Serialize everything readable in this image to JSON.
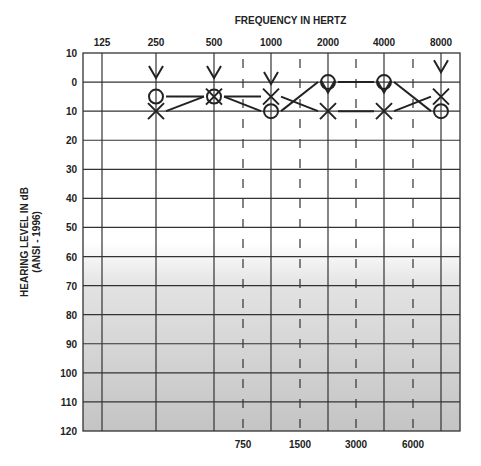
{
  "chart_data": {
    "type": "scatter",
    "title": "FREQUENCY IN HERTZ",
    "ylabel": "HEARING LEVEL IN dB (ANSI - 1996)",
    "ylabel_line1": "HEARING LEVEL IN dB",
    "ylabel_line2": "(ANSI - 1996)",
    "x_top_ticks": [
      "125",
      "250",
      "500",
      "1000",
      "2000",
      "4000",
      "8000"
    ],
    "x_bottom_ticks": [
      "750",
      "1500",
      "3000",
      "6000"
    ],
    "y_ticks": [
      "10",
      "0",
      "10",
      "20",
      "30",
      "40",
      "50",
      "60",
      "70",
      "80",
      "90",
      "100",
      "110",
      "120"
    ],
    "ylim": [
      -10,
      120
    ],
    "y_inverted": true,
    "grid": true,
    "categories": [
      250,
      500,
      1000,
      2000,
      4000,
      8000
    ],
    "series": [
      {
        "name": "Right ear air conduction (O)",
        "symbol": "circle",
        "values": [
          5,
          5,
          10,
          0,
          0,
          10
        ]
      },
      {
        "name": "Left ear air conduction (X)",
        "symbol": "x",
        "values": [
          10,
          5,
          5,
          10,
          10,
          5
        ]
      },
      {
        "name": "Bone conduction (V)",
        "symbol": "v",
        "values": [
          0,
          0,
          2,
          5,
          5,
          -2
        ]
      }
    ],
    "background_gradient": {
      "from": "#ffffff",
      "to": "#c8c8c8",
      "start_db": 50
    }
  }
}
